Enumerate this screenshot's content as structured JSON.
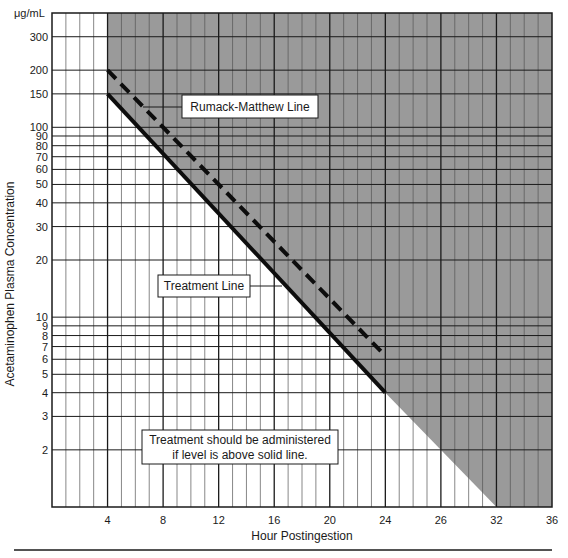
{
  "chart_data": {
    "type": "line",
    "title": "",
    "xlabel": "Hour Postingestion",
    "ylabel": "Acetaminophen Plasma Concentration",
    "y_unit_label": "μg/mL",
    "yscale": "log",
    "xlim": [
      0,
      36
    ],
    "ylim": [
      1,
      400
    ],
    "grid": true,
    "x_ticks": [
      4,
      8,
      12,
      16,
      20,
      24,
      28,
      32,
      36
    ],
    "x_tick_labels": [
      "4",
      "8",
      "12",
      "16",
      "20",
      "24",
      "26",
      "32",
      "36"
    ],
    "x_minor_step": 1,
    "y_ticks": [
      300,
      200,
      150,
      100,
      90,
      80,
      70,
      60,
      50,
      40,
      30,
      20,
      10,
      9,
      8,
      7,
      6,
      5,
      4,
      3,
      2
    ],
    "y_tick_labels": [
      "300",
      "200",
      "150",
      "100",
      "90",
      "80",
      "70",
      "60",
      "50",
      "40",
      "30",
      "20",
      "10",
      "9",
      "8",
      "7",
      "6",
      "5",
      "4",
      "3",
      "2"
    ],
    "series": [
      {
        "name": "Rumack-Matthew Line",
        "style": "dashed",
        "x": [
          4,
          24
        ],
        "y": [
          200,
          6.25
        ]
      },
      {
        "name": "Treatment Line",
        "style": "solid",
        "x": [
          4,
          24
        ],
        "y": [
          150,
          4
        ]
      }
    ],
    "shaded_region": {
      "description": "Area above treatment line extended (from hour 4 onward)",
      "boundary_x": [
        4,
        4,
        24,
        32,
        36,
        36
      ],
      "boundary_y": [
        400,
        150,
        4,
        1,
        1,
        400
      ],
      "color": "#9a9a9a"
    },
    "annotations": [
      {
        "text": "Rumack-Matthew Line",
        "points_to": "Rumack-Matthew Line"
      },
      {
        "text": "Treatment Line",
        "points_to": "Treatment Line"
      },
      {
        "text_lines": [
          "Treatment should be administered",
          "if level is above solid line."
        ]
      }
    ]
  },
  "labels": {
    "unit": "μg/mL",
    "ylabel": "Acetaminophen Plasma Concentration",
    "xlabel": "Hour Postingestion",
    "rumack": "Rumack-Matthew Line",
    "treatment": "Treatment Line",
    "note_line1": "Treatment should be administered",
    "note_line2": "if level is above solid line."
  },
  "colors": {
    "shade": "#9a9a9a",
    "grid_major": "#1a1a1a",
    "grid_minor": "#555555",
    "line": "#0d0d0d"
  }
}
